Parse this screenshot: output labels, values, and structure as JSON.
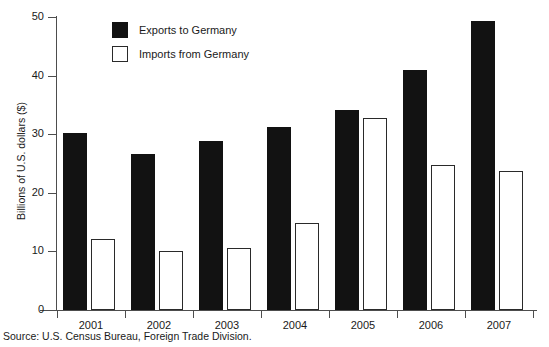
{
  "chart_data": {
    "type": "bar",
    "title": "",
    "xlabel": "",
    "ylabel": "Billions of U.S. dollars ($)",
    "categories": [
      "2001",
      "2002",
      "2003",
      "2004",
      "2005",
      "2006",
      "2007"
    ],
    "series": [
      {
        "name": "Exports to Germany",
        "color": "#121212",
        "values": [
          30.2,
          26.7,
          28.8,
          31.3,
          34.1,
          40.9,
          49.4
        ]
      },
      {
        "name": "Imports from Germany",
        "color": "#ffffff",
        "values": [
          12.2,
          10.1,
          10.6,
          14.9,
          32.7,
          24.8,
          23.8
        ]
      }
    ],
    "ylim": [
      0,
      50
    ],
    "yticks": [
      0,
      10,
      20,
      30,
      40,
      50
    ],
    "ytick_labels": [
      "0",
      "10",
      "20",
      "30",
      "40",
      "50"
    ],
    "grid": false,
    "legend_position": "upper left"
  },
  "source": {
    "text": "Source: U.S. Census Bureau, Foreign Trade Division."
  },
  "legend": {
    "entries": [
      {
        "label": "Exports to Germany"
      },
      {
        "label": "Imports from Germany"
      }
    ]
  }
}
